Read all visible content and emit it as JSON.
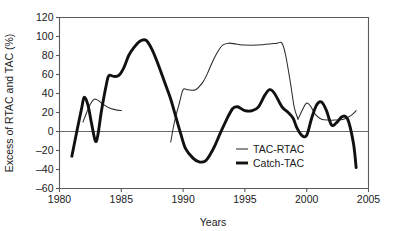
{
  "chart_data": {
    "type": "line",
    "title": "",
    "xlabel": "Years",
    "ylabel": "Excess of RTAC and TAC (%)",
    "xlim": [
      1980,
      2005
    ],
    "ylim": [
      -60,
      120
    ],
    "xticks": [
      1980,
      1985,
      1990,
      1995,
      2000,
      2005
    ],
    "yticks": [
      -60,
      -40,
      -20,
      0,
      20,
      40,
      60,
      80,
      100,
      120
    ],
    "grid": false,
    "zero_line": true,
    "legend_position": "center-right",
    "series": [
      {
        "name": "TAC-RTAC",
        "style": "thin",
        "segments": [
          {
            "x": [
              1981.9,
              1982.2,
              1982.5,
              1982.8,
              1983.1,
              1983.5,
              1984.0,
              1984.5,
              1985.0
            ],
            "y": [
              10,
              20,
              29,
              34,
              33,
              29,
              25,
              23,
              22
            ]
          },
          {
            "x": [
              1989.0,
              1989.3,
              1989.7,
              1990.0,
              1990.4,
              1991.0,
              1991.6,
              1992.0,
              1992.4,
              1992.8,
              1993.2,
              1993.7,
              1994.3,
              1995.0,
              1996.0,
              1997.0,
              1997.6,
              1998.0,
              1998.3,
              1998.7,
              1999.0,
              1999.3
            ],
            "y": [
              -11,
              10,
              30,
              44,
              44,
              44,
              52,
              62,
              74,
              84,
              91,
              93,
              92,
              91,
              91,
              92,
              93,
              93,
              80,
              50,
              25,
              13
            ]
          },
          {
            "x": [
              1999.3,
              1999.7,
              2000.0,
              2000.3,
              2000.7,
              2001.2,
              2001.8,
              2002.3,
              2003.0,
              2003.6,
              2004.0
            ],
            "y": [
              13,
              24,
              30,
              27,
              18,
              13,
              12,
              12,
              13,
              17,
              22
            ]
          }
        ]
      },
      {
        "name": "Catch-TAC",
        "style": "thick",
        "segments": [
          {
            "x": [
              1981.0,
              1981.4,
              1981.8,
              1982.0,
              1982.3,
              1982.6,
              1982.9,
              1983.1,
              1983.4,
              1983.8,
              1984.0,
              1984.4,
              1984.8,
              1985.2,
              1985.6,
              1986.0,
              1986.5,
              1987.0,
              1987.5,
              1988.0,
              1988.5,
              1989.0,
              1989.4,
              1989.8,
              1990.2,
              1990.8,
              1991.3,
              1991.8,
              1992.2,
              1992.6,
              1993.0,
              1993.5,
              1994.0,
              1994.4,
              1995.0,
              1995.6,
              1996.1,
              1996.6,
              1997.0,
              1997.4,
              1998.0,
              1998.5,
              1998.9,
              1999.2,
              1999.6,
              2000.0,
              2000.4,
              2000.8,
              2001.2,
              2001.6,
              2002.0,
              2002.4,
              2002.8,
              2003.1,
              2003.4,
              2003.8,
              2004.0
            ],
            "y": [
              -26,
              0,
              25,
              36,
              28,
              8,
              -10,
              -4,
              22,
              50,
              59,
              58,
              59,
              67,
              80,
              88,
              95,
              96,
              86,
              70,
              52,
              34,
              16,
              -2,
              -18,
              -28,
              -32,
              -31,
              -24,
              -14,
              -2,
              12,
              24,
              26,
              22,
              22,
              26,
              38,
              44,
              40,
              26,
              20,
              14,
              4,
              -4,
              -4,
              14,
              28,
              31,
              22,
              7,
              9,
              15,
              16,
              10,
              -14,
              -38
            ]
          }
        ]
      }
    ]
  },
  "legend": {
    "items": [
      {
        "label": "TAC-RTAC"
      },
      {
        "label": "Catch-TAC"
      }
    ]
  },
  "axes": {
    "x_title": "Years",
    "y_title": "Excess of RTAC and TAC (%)",
    "x_tick_labels": [
      "1980",
      "1985",
      "1990",
      "1995",
      "2000",
      "2005"
    ],
    "y_tick_labels": [
      "120",
      "100",
      "80",
      "60",
      "40",
      "20",
      "0",
      "–20",
      "–40",
      "–60"
    ]
  }
}
